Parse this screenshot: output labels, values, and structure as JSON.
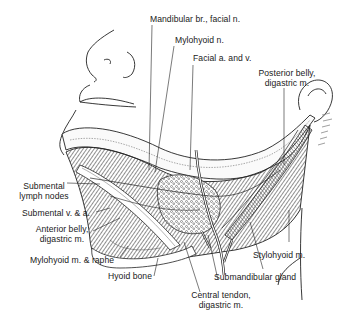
{
  "figure": {
    "labels": {
      "mandibular_branch": "Mandibular br., facial n.",
      "mylohyoid_nerve": "Mylohyoid n.",
      "facial_artery_vein": "Facial a. and v.",
      "posterior_belly_line1": "Posterior belly,",
      "posterior_belly_line2": "digastric m.",
      "submental_nodes_line1": "Submental",
      "submental_nodes_line2": "lymph nodes",
      "submental_vessels": "Submental v. & a.",
      "anterior_belly_line1": "Anterior belly,",
      "anterior_belly_line2": "digastric m.",
      "mylohyoid_raphe": "Mylohyoid m. & raphe",
      "hyoid_bone": "Hyoid bone",
      "stylohyoid": "Stylohyoid m.",
      "submandibular_gland": "Submandibular gland",
      "central_tendon_line1": "Central tendon,",
      "central_tendon_line2": "digastric m."
    },
    "colors": {
      "ink": "#1a1a1a",
      "background": "#ffffff",
      "hatch": "#3a3a3a"
    }
  }
}
